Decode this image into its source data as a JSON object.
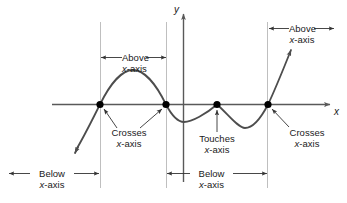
{
  "figure": {
    "kind": "math-diagram",
    "title_visible": false,
    "background_color": "#ffffff",
    "curve_color": "#4d4d4d",
    "axis_color": "#595959",
    "guide_color": "#bfbfbf",
    "dot_color": "#000000",
    "text_color": "#1a1a1a",
    "width": 347,
    "height": 203
  },
  "axes": {
    "x_label": "x",
    "y_label": "y",
    "x_axis_y": 104,
    "y_axis_x": 183
  },
  "roots": [
    {
      "id": "root-1",
      "x": 100,
      "behavior": "crosses"
    },
    {
      "id": "root-2",
      "x": 166,
      "behavior": "crosses"
    },
    {
      "id": "root-3",
      "x": 217,
      "behavior": "touches"
    },
    {
      "id": "root-4",
      "x": 268,
      "behavior": "crosses"
    }
  ],
  "callouts": [
    {
      "id": "crosses-left",
      "line1": "Crosses",
      "line2_italic": "x",
      "line2_rest": "-axis"
    },
    {
      "id": "touches-middle",
      "line1": "Touches",
      "line2_italic": "x",
      "line2_rest": "-axis"
    },
    {
      "id": "crosses-right",
      "line1": "Crosses",
      "line2_italic": "x",
      "line2_rest": "-axis"
    }
  ],
  "intervals": [
    {
      "id": "above-middle",
      "line1": "Above",
      "line2_italic": "x",
      "line2_rest": "-axis",
      "from_x": 100,
      "to_x": 166,
      "position": "top"
    },
    {
      "id": "above-right",
      "line1": "Above",
      "line2_italic": "x",
      "line2_rest": "-axis",
      "from_x": 268,
      "to_x": 340,
      "position": "top"
    },
    {
      "id": "below-left",
      "line1": "Below",
      "line2_italic": "x",
      "line2_rest": "-axis",
      "from_x": 8,
      "to_x": 100,
      "position": "bottom"
    },
    {
      "id": "below-middle",
      "line1": "Below",
      "line2_italic": "x",
      "line2_rest": "-axis",
      "from_x": 166,
      "to_x": 268,
      "position": "bottom"
    }
  ]
}
